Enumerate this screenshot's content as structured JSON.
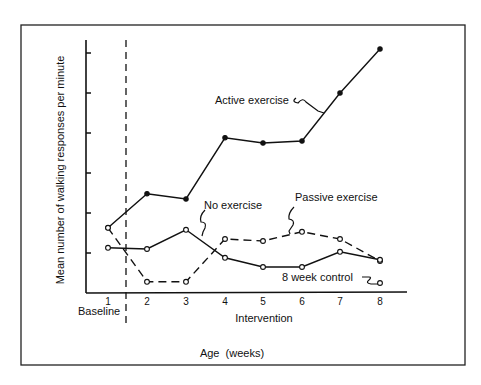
{
  "chart_data": {
    "type": "line",
    "title": "",
    "xlabel": "Age  (weeks)",
    "ylabel": "Mean number of walking responses per minute",
    "x": [
      1,
      2,
      3,
      4,
      5,
      6,
      7,
      8
    ],
    "x_tick_labels": [
      "1",
      "2",
      "3",
      "4",
      "5",
      "6",
      "7",
      "8"
    ],
    "y_ticks": [
      1,
      2,
      3,
      4,
      5,
      6
    ],
    "y_tick_labels_shown": false,
    "ylim": [
      0,
      6.3
    ],
    "xlim": [
      0.4,
      9.2
    ],
    "grid": false,
    "legend": "inline annotations",
    "phase_divider": {
      "x": 1.5,
      "style": "dashed"
    },
    "phase_labels": [
      "Baseline",
      "Intervention"
    ],
    "series": [
      {
        "name": "Active exercise",
        "line_style": "solid",
        "marker": "filled-circle",
        "values": [
          1.63,
          2.48,
          2.35,
          3.88,
          3.75,
          3.8,
          5.0,
          6.1
        ]
      },
      {
        "name": "Passive exercise",
        "line_style": "dashed",
        "marker": "open-circle",
        "values": [
          1.63,
          0.28,
          0.28,
          1.35,
          1.3,
          1.53,
          1.35,
          0.8
        ]
      },
      {
        "name": "No exercise",
        "line_style": "solid",
        "marker": "open-circle",
        "values": [
          1.13,
          1.1,
          1.58,
          0.88,
          0.65,
          0.65,
          1.03,
          0.83
        ]
      },
      {
        "name": "8 week control",
        "line_style": "none",
        "marker": "open-circle",
        "points": [
          {
            "x": 8,
            "y": 0.25
          }
        ]
      }
    ],
    "annotations": [
      {
        "text": "Active exercise",
        "points_to_week": 6.6
      },
      {
        "text": "Passive exercise",
        "points_to_week": 5.5
      },
      {
        "text": "No exercise",
        "points_to_week": 3.4
      },
      {
        "text": "8 week control",
        "points_to_week": 8
      }
    ]
  },
  "labels": {
    "baseline": "Baseline",
    "intervention": "Intervention",
    "x_axis_title": "Age  (weeks)",
    "y_axis_title": "Mean number of walking responses per minute",
    "active": "Active exercise",
    "passive": "Passive exercise",
    "none": "No exercise",
    "control": "8 week control"
  }
}
